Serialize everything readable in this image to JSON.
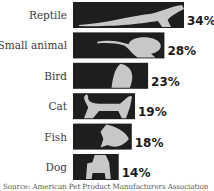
{
  "chart_data": {
    "type": "bar",
    "orientation": "horizontal",
    "title": "",
    "xlabel": "",
    "ylabel": "",
    "categories": [
      "Reptile",
      "Small animal",
      "Bird",
      "Cat",
      "Fish",
      "Dog"
    ],
    "values": [
      34,
      28,
      23,
      19,
      18,
      14
    ],
    "value_labels": [
      "34%",
      "28%",
      "23%",
      "19%",
      "18%",
      "14%"
    ],
    "unit": "%",
    "xlim": [
      0,
      34
    ],
    "grid": false,
    "legend": "none",
    "bar_color": "#1e1e1e",
    "silhouette_color": "#c8c8c8",
    "silhouettes": [
      "lizard",
      "rodent",
      "parrot",
      "cat",
      "goldfish",
      "dog"
    ],
    "source": "Source: American Pet Product Manufacturers Association"
  }
}
